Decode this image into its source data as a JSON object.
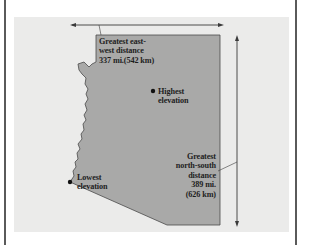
{
  "figure": {
    "colors": {
      "background": "#ffffff",
      "panel": "#ebebea",
      "state_fill": "#a9a9a8",
      "state_outline": "#4a4a4a",
      "arrow": "#3a3a3a",
      "text": "#1e1e1e"
    },
    "annotations": {
      "east_west": {
        "lines": [
          "Greatest east-",
          "west distance",
          "337 mi.(542 km)"
        ]
      },
      "highest": {
        "lines": [
          "Highest",
          "elevation"
        ]
      },
      "lowest": {
        "lines": [
          "Lowest",
          "elevation"
        ]
      },
      "north_south": {
        "lines": [
          "Greatest",
          "north-south",
          "distance",
          "389 mi.",
          "(626 km)"
        ]
      }
    }
  }
}
